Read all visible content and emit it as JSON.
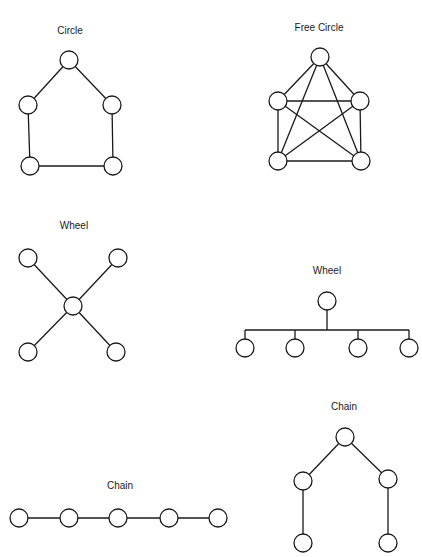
{
  "diagrams": [
    {
      "id": "circle",
      "title": "Circle",
      "label_pos": [
        70,
        31
      ],
      "nodes": [
        [
          69,
          60
        ],
        [
          28,
          105
        ],
        [
          112,
          105
        ],
        [
          30,
          166
        ],
        [
          113,
          166
        ]
      ],
      "edges": [
        [
          0,
          1
        ],
        [
          0,
          2
        ],
        [
          1,
          3
        ],
        [
          2,
          4
        ],
        [
          3,
          4
        ]
      ],
      "radius": 9
    },
    {
      "id": "free-circle",
      "title": "Free Circle",
      "label_pos": [
        319,
        28
      ],
      "nodes": [
        [
          320,
          57
        ],
        [
          278,
          101
        ],
        [
          360,
          101
        ],
        [
          278,
          161
        ],
        [
          361,
          161
        ]
      ],
      "edges": [
        [
          0,
          1
        ],
        [
          0,
          2
        ],
        [
          0,
          3
        ],
        [
          0,
          4
        ],
        [
          1,
          2
        ],
        [
          1,
          3
        ],
        [
          1,
          4
        ],
        [
          2,
          3
        ],
        [
          2,
          4
        ],
        [
          3,
          4
        ]
      ],
      "radius": 9
    },
    {
      "id": "wheel-star",
      "title": "Wheel",
      "label_pos": [
        74,
        226
      ],
      "nodes": [
        [
          73,
          306
        ],
        [
          28,
          258
        ],
        [
          118,
          258
        ],
        [
          28,
          352
        ],
        [
          116,
          352
        ]
      ],
      "edges": [
        [
          0,
          1
        ],
        [
          0,
          2
        ],
        [
          0,
          3
        ],
        [
          0,
          4
        ]
      ],
      "radius": 9
    },
    {
      "id": "wheel-tree",
      "title": "Wheel",
      "label_pos": [
        327,
        271
      ],
      "nodes": [
        [
          327,
          301
        ],
        [
          245,
          348
        ],
        [
          295,
          348
        ],
        [
          358,
          348
        ],
        [
          409,
          348
        ]
      ],
      "bus_y": 330,
      "radius": 9
    },
    {
      "id": "chain-line",
      "title": "Chain",
      "label_pos": [
        120,
        486
      ],
      "nodes": [
        [
          19,
          518
        ],
        [
          69,
          518
        ],
        [
          118,
          518
        ],
        [
          169,
          518
        ],
        [
          218,
          518
        ]
      ],
      "edges": [
        [
          0,
          1
        ],
        [
          1,
          2
        ],
        [
          2,
          3
        ],
        [
          3,
          4
        ]
      ],
      "radius": 9
    },
    {
      "id": "chain-tree",
      "title": "Chain",
      "label_pos": [
        344,
        407
      ],
      "nodes": [
        [
          345,
          437
        ],
        [
          303,
          481
        ],
        [
          388,
          479
        ],
        [
          303,
          543
        ],
        [
          388,
          543
        ]
      ],
      "edges": [
        [
          0,
          1
        ],
        [
          0,
          2
        ],
        [
          1,
          3
        ],
        [
          2,
          4
        ]
      ],
      "radius": 9
    }
  ]
}
